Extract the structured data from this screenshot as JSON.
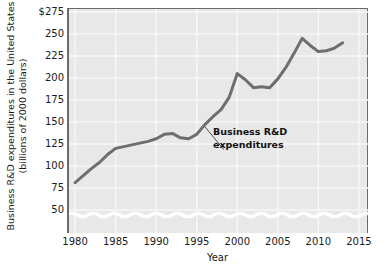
{
  "chart_data": {
    "type": "line",
    "title": "",
    "xlabel": "Year",
    "ylabel_lines": [
      "Business R&D expenditures in the United States",
      "(billions of 2000 dollars)"
    ],
    "ylabel": "Business R&D expenditures in the United States (billions of 2000 dollars)",
    "xlim": [
      1979,
      2016
    ],
    "ylim": [
      40,
      275
    ],
    "y_axis_break": true,
    "grid": true,
    "legend": "none",
    "series_annotation": {
      "lines": [
        "Business R&D",
        "expenditures"
      ],
      "points_to_year": 1996
    },
    "xticks": [
      "1980",
      "1985",
      "1990",
      "1995",
      "2000",
      "2005",
      "2010",
      "2015"
    ],
    "xtick_values": [
      1980,
      1985,
      1990,
      1995,
      2000,
      2005,
      2010,
      2015
    ],
    "yticks": [
      "$275",
      "250",
      "225",
      "200",
      "175",
      "150",
      "125",
      "100",
      "75",
      "50"
    ],
    "ytick_values": [
      275,
      250,
      225,
      200,
      175,
      150,
      125,
      100,
      75,
      50
    ],
    "series": [
      {
        "name": "Business R&D expenditures",
        "color": "#6e6e6e",
        "x": [
          1980,
          1981,
          1982,
          1983,
          1984,
          1985,
          1986,
          1987,
          1988,
          1989,
          1990,
          1991,
          1992,
          1993,
          1994,
          1995,
          1996,
          1997,
          1998,
          1999,
          2000,
          2001,
          2002,
          2003,
          2004,
          2005,
          2006,
          2007,
          2008,
          2009,
          2010,
          2011,
          2012,
          2013
        ],
        "values": [
          81,
          89,
          97,
          104,
          113,
          120,
          122,
          124,
          126,
          128,
          131,
          136,
          137,
          132,
          131,
          136,
          147,
          156,
          164,
          178,
          205,
          198,
          189,
          190,
          189,
          199,
          212,
          228,
          245,
          237,
          230,
          231,
          234,
          240
        ]
      }
    ]
  },
  "figure": {
    "background_color": "#ffffff",
    "plot_background_color": "#e8e8e8",
    "gridline_color": "#f7f7f7",
    "axis_color": "#6b6b6b",
    "text_color": "#1a1a1a"
  }
}
